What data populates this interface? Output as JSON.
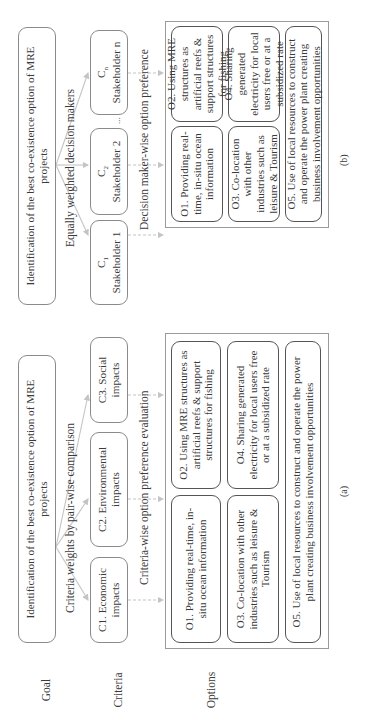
{
  "row_labels": {
    "goal": "Goal",
    "criteria": "Criteria",
    "options": "Options"
  },
  "panel_a": {
    "label": "(a)",
    "goal": "Identification of the best co-existence option of MRE projects",
    "goal_to_criteria_label": "Criteria weights by pair-wise comparison",
    "criteria": [
      {
        "id": "C1",
        "text": "C1. Economic impacts"
      },
      {
        "id": "C2",
        "text": "C2. Environmental impacts"
      },
      {
        "id": "C3",
        "text": "C3. Social impacts"
      }
    ],
    "criteria_to_options_label": "Criteria-wise option preference evaluation",
    "options": [
      {
        "id": "O1",
        "text": "O1. Providing real-time, in-situ ocean information"
      },
      {
        "id": "O2",
        "text": "O2. Using MRE structures as artificial reefs & support structures for fishing"
      },
      {
        "id": "O3",
        "text": "O3. Co-location with other industries such as leisure & Tourism"
      },
      {
        "id": "O4",
        "text": "O4. Sharing generated electricity for local users free or at a subsidized rate"
      },
      {
        "id": "O5",
        "text": "O5. Use of local resources to construct and operate the power plant creating business involvement opportunities"
      }
    ]
  },
  "panel_b": {
    "label": "(b)",
    "goal": "Identification of the best co-existence option of MRE projects",
    "goal_to_stakeholders_label": "Equally weighted decision makers",
    "stakeholders": [
      {
        "code": "C",
        "sub": "1",
        "name": "Stakeholder 1"
      },
      {
        "code": "C",
        "sub": "2",
        "name": "Stakeholder 2"
      },
      {
        "code": "C",
        "sub": "n",
        "name": "Stakeholder n"
      }
    ],
    "ellipsis": "...",
    "stakeholders_to_options_label": "Decision maker-wise option preference",
    "options": [
      {
        "id": "O1",
        "text": "O1. Providing real-time, in-situ ocean information"
      },
      {
        "id": "O2",
        "text": "O2. Using MRE structures as artificial reefs & support structures for fishing"
      },
      {
        "id": "O3",
        "text": "O3. Co-location with other industries such as leisure & Tourism"
      },
      {
        "id": "O4",
        "text": "O4. Sharing generated electricity for local users free or at a subsidized rate"
      },
      {
        "id": "O5",
        "text": "O5. Use of local resources to construct and operate the power plant creating business involvement opportunities"
      }
    ]
  },
  "colors": {
    "connector": "#c4c4c4",
    "box_border": "#8a8a8a",
    "option_border": "#555555",
    "text": "#3a3a3a"
  }
}
